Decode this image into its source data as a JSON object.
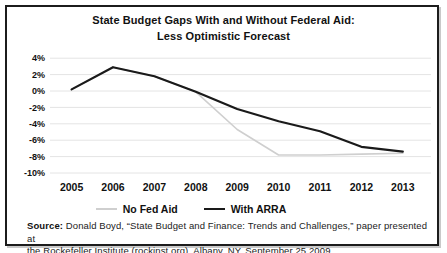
{
  "title": {
    "line1": "State Budget Gaps With and Without Federal Aid:",
    "line2": "Less Optimistic Forecast"
  },
  "legend": {
    "items": [
      "No Fed Aid",
      "With ARRA"
    ]
  },
  "source": {
    "label": "Source:",
    "line1": "Donald Boyd, “State Budget and Finance: Trends and Challenges,” paper presented at",
    "line2": "the Rockefeller Institute (rockinst.org), Albany, NY, September 25 2009. ."
  },
  "chart_data": {
    "type": "line",
    "title": "State Budget Gaps With and Without Federal Aid: Less Optimistic Forecast",
    "categories": [
      "2005",
      "2006",
      "2007",
      "2008",
      "2009",
      "2010",
      "2011",
      "2012",
      "2013"
    ],
    "xlabel": "",
    "ylabel": "",
    "ylim": [
      -10,
      4
    ],
    "grid": "horizontal",
    "grid_color": "#e4e4e4",
    "legend_position": "bottom",
    "yticks": [
      {
        "label": "4%",
        "value": 4
      },
      {
        "label": "2%",
        "value": 2
      },
      {
        "label": "0%",
        "value": 0
      },
      {
        "label": "-2%",
        "value": -2
      },
      {
        "label": "-4%",
        "value": -4
      },
      {
        "label": "-6%",
        "value": -6
      },
      {
        "label": "-8%",
        "value": -8
      },
      {
        "label": "-10%",
        "value": -10
      }
    ],
    "series": [
      {
        "id": "no-fed-aid",
        "name": "No Fed Aid",
        "color": "#cfcfcf",
        "stroke_width": 1.6,
        "values": [
          0.2,
          2.9,
          1.8,
          -0.1,
          -4.7,
          -7.8,
          -7.8,
          -7.7,
          -7.6
        ]
      },
      {
        "id": "with-arra",
        "name": "With ARRA",
        "color": "#1a1a1a",
        "stroke_width": 2.2,
        "values": [
          0.2,
          2.9,
          1.8,
          -0.1,
          -2.2,
          -3.7,
          -4.9,
          -6.8,
          -7.4
        ]
      }
    ]
  }
}
